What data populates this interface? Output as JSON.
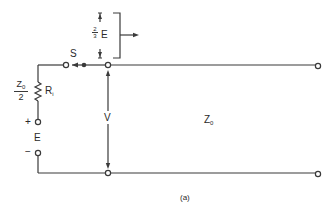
{
  "diagram": {
    "caption": "(a)",
    "labels": {
      "switch": "S",
      "source_impedance_num": "Z",
      "source_impedance_num_sub": "0",
      "source_impedance_den": "2",
      "resistor": "R",
      "resistor_sub": "i",
      "plus": "+",
      "minus": "−",
      "source": "E",
      "voltage": "V",
      "line_impedance": "Z",
      "line_impedance_sub": "0",
      "pulse_frac_num": "2",
      "pulse_frac_den": "3",
      "pulse_symbol": "E"
    },
    "colors": {
      "line": "#3a3a3a",
      "text": "#2a2a2a",
      "background": "#ffffff"
    }
  }
}
